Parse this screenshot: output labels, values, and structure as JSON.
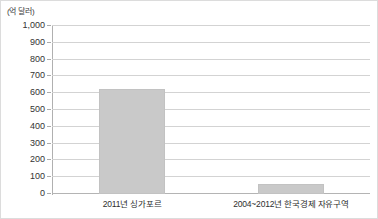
{
  "chart_data": {
    "type": "bar",
    "title": "",
    "subtitle": "",
    "unit_label": "(억 달러)",
    "xlabel": "",
    "ylabel": "",
    "categories": [
      "2011년 싱가포르",
      "2004~2012년 한국경제 자유구역"
    ],
    "values": [
      625,
      62
    ],
    "ylim": [
      0,
      1000
    ],
    "ytick_labels": [
      "1,000",
      "900",
      "800",
      "700",
      "600",
      "500",
      "400",
      "300",
      "200",
      "100",
      "0"
    ],
    "ytick_values": [
      1000,
      900,
      800,
      700,
      600,
      500,
      400,
      300,
      200,
      100,
      0
    ],
    "grid": true,
    "legend": false,
    "legend_position": "none",
    "series": [
      {
        "name": "외국인직접투자 누계",
        "values": [
          625,
          62
        ]
      }
    ],
    "colors": {
      "bar_fill": "#c9c9c9",
      "bar_border": "#c2c2c2",
      "gridline": "#d3d3d3",
      "axis": "#b0b0b0",
      "text": "#333333",
      "frame": "#dcdcdc",
      "background": "#ffffff"
    }
  }
}
